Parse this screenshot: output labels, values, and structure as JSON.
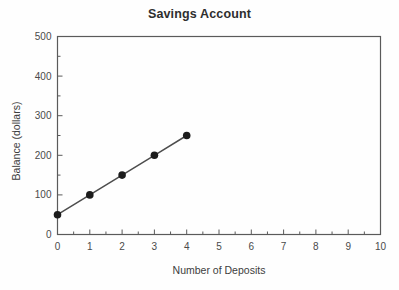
{
  "chart_data": {
    "type": "line",
    "title": "Savings Account",
    "xlabel": "Number of Deposits",
    "ylabel": "Balance (dollars)",
    "xlim": [
      0,
      10
    ],
    "ylim": [
      0,
      500
    ],
    "grid": false,
    "legend": "none",
    "x_ticks": [
      0,
      1,
      2,
      3,
      4,
      5,
      6,
      7,
      8,
      9,
      10
    ],
    "x_tick_labels": [
      "0",
      "1",
      "2",
      "3",
      "4",
      "5",
      "6",
      "7",
      "8",
      "9",
      "10"
    ],
    "x_minor_tick_interval": 0.5,
    "y_ticks": [
      0,
      100,
      200,
      300,
      400,
      500
    ],
    "y_tick_labels": [
      "0",
      "100",
      "200",
      "300",
      "400",
      "500"
    ],
    "y_minor_tick_interval": 50,
    "series": [
      {
        "name": "Balance",
        "marker": "filled-circle",
        "marker_color": "#1c1c1c",
        "line_color": "#4d4d4d",
        "x": [
          0,
          1,
          2,
          3,
          4
        ],
        "values": [
          50,
          100,
          150,
          200,
          250
        ],
        "points": [
          {
            "x": 0,
            "y": 50
          },
          {
            "x": 1,
            "y": 100
          },
          {
            "x": 2,
            "y": 150
          },
          {
            "x": 3,
            "y": 200
          },
          {
            "x": 4,
            "y": 250
          }
        ]
      }
    ],
    "colors": {
      "frame": "#5a5a5a",
      "marker": "#1c1c1c",
      "line": "#4d4d4d",
      "title_text": "#2e2e2e",
      "axis_text": "#3d3d3d",
      "background": "#fefefe"
    }
  }
}
